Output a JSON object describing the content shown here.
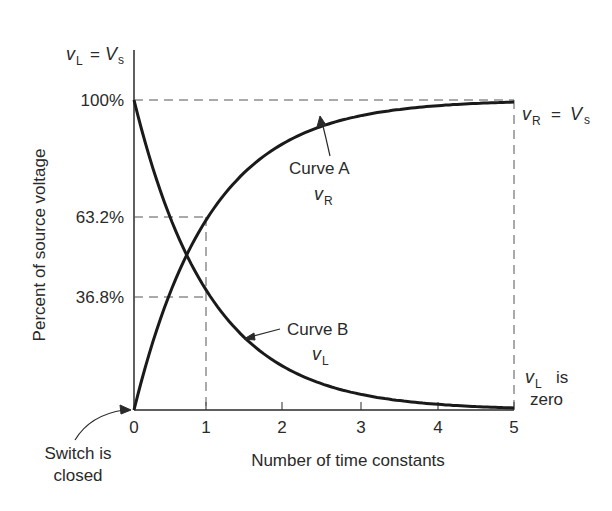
{
  "chart_data": {
    "type": "line",
    "title": "",
    "xlabel": "Number of time constants",
    "ylabel": "Percent of source voltage",
    "xlim": [
      0,
      5
    ],
    "ylim": [
      0,
      100
    ],
    "x_ticks": [
      "0",
      "1",
      "2",
      "3",
      "4",
      "5"
    ],
    "y_ticks": [
      "36.8%",
      "63.2%",
      "100%"
    ],
    "grid": false,
    "x": [
      0,
      0.5,
      1,
      1.5,
      2,
      2.5,
      3,
      3.5,
      4,
      4.5,
      5
    ],
    "series": [
      {
        "name": "Curve A (vR)",
        "values": [
          0,
          39.3,
          63.2,
          77.7,
          86.5,
          91.8,
          95.0,
          97.0,
          98.2,
          98.9,
          99.3
        ]
      },
      {
        "name": "Curve B (vL)",
        "values": [
          100,
          60.7,
          36.8,
          22.3,
          13.5,
          8.2,
          5.0,
          3.0,
          1.8,
          1.1,
          0.7
        ]
      }
    ],
    "annotations": [
      "vL = Vs",
      "vR = Vs",
      "Curve A",
      "vR",
      "Curve B",
      "vL",
      "vL is zero",
      "Switch is closed"
    ]
  },
  "labels": {
    "top_left": {
      "v": "v",
      "sub": "L",
      "eq": "=",
      "V": "V",
      "Vsub": "s"
    },
    "right_top": {
      "v": "v",
      "sub": "R",
      "eq": "=",
      "V": "V",
      "Vsub": "s"
    },
    "curve_a": {
      "name": "Curve A",
      "v": "v",
      "sub": "R"
    },
    "curve_b": {
      "name": "Curve B",
      "v": "v",
      "sub": "L"
    },
    "right_bottom": {
      "v": "v",
      "sub": "L",
      "line1": "is",
      "line2": "zero"
    },
    "switch": {
      "line1": "Switch is",
      "line2": "closed"
    },
    "xlabel": "Number of time constants",
    "ylabel": "Percent of source voltage",
    "xticks": [
      "0",
      "1",
      "2",
      "3",
      "4",
      "5"
    ],
    "yticks": {
      "p100": "100%",
      "p632": "63.2%",
      "p368": "36.8%"
    }
  }
}
